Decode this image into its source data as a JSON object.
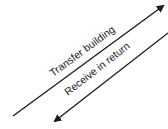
{
  "diagram": {
    "arrows": [
      {
        "label": "Transfer building",
        "direction": "up-right",
        "color": "#1a1a1a"
      },
      {
        "label": "Receive in return",
        "direction": "down-left",
        "color": "#1a1a1a"
      }
    ]
  }
}
